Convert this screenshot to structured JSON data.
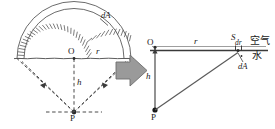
{
  "figure": {
    "title": "",
    "colors": {
      "stroke": "#4a4a4a",
      "stroke_dark": "#2b2b2b",
      "arrow_fill": "#9a9a9a",
      "arrow_stroke": "#6e6e6e",
      "text": "#1a1a1a",
      "background": "#ffffff"
    }
  },
  "left_diagram": {
    "name": "hemispherical-dome-diagram",
    "labels": {
      "center_point": "O",
      "radius": "r",
      "depth": "h",
      "source_point": "P",
      "area_element": "dA"
    },
    "arc_segments": 26
  },
  "arrow": {
    "name": "transform-arrow",
    "direction": "right"
  },
  "right_diagram": {
    "name": "flat-surface-diagram",
    "labels": {
      "origin": "O",
      "radius": "r",
      "depth": "h",
      "source_point": "P",
      "ring_point": "S",
      "ring_width": "dr",
      "area_element": "dA",
      "medium_upper": "空气",
      "medium_lower": "水"
    }
  }
}
